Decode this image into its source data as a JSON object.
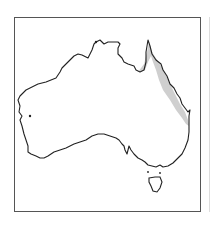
{
  "map": {
    "region": "Australia",
    "shaded_region": "north-east coast of Queensland (eastern coastal strip)",
    "colors": {
      "outline": "#222222",
      "shaded": "#cfcfcf",
      "frame": "#555555",
      "background": "#ffffff"
    }
  }
}
